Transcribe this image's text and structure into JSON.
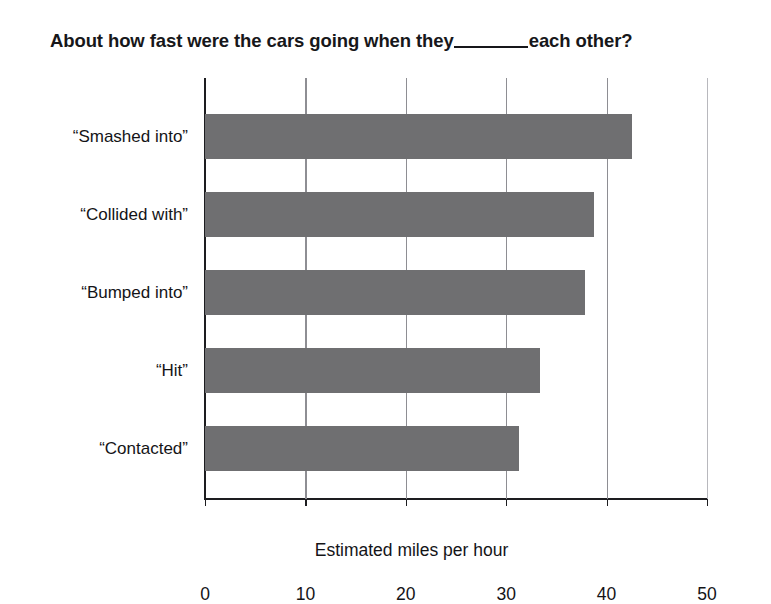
{
  "chart_data": {
    "type": "bar",
    "orientation": "horizontal",
    "title_prefix": "About how fast were the cars going when they",
    "title_suffix": "each other?",
    "title_blank": "____",
    "categories": [
      "“Smashed into”",
      "“Collided with”",
      "“Bumped into”",
      "“Hit”",
      "“Contacted”"
    ],
    "values": [
      42.5,
      38.7,
      37.8,
      33.4,
      31.3
    ],
    "xlabel": "Estimated miles per hour",
    "ylabel": "",
    "xlim": [
      0,
      50
    ],
    "xticks": [
      0,
      10,
      20,
      30,
      40,
      50
    ],
    "xtick_labels": [
      "0",
      "10",
      "20",
      "30",
      "40",
      "50"
    ],
    "grid": "vertical",
    "legend": "none",
    "bar_color": "#6f6f71",
    "axis_color": "#1d1d20",
    "gridline_color": "#8e8e93",
    "background_color": "#ffffff"
  }
}
